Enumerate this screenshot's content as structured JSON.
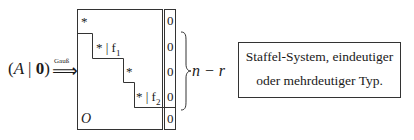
{
  "lhs": {
    "open": "(",
    "matrix": "A",
    "bar": "|",
    "zero_vector": "0",
    "close": ")"
  },
  "arrow": {
    "label": "Gauß",
    "glyph": "⟹"
  },
  "matrix": {
    "rows": [
      {
        "entry": "*",
        "rhs": "0"
      },
      {
        "entry": "* | f",
        "entry_sub": "1",
        "rhs": "0"
      },
      {
        "entry": "*",
        "rhs": "0"
      },
      {
        "entry": "* | f",
        "entry_sub": "2",
        "rhs": "0"
      }
    ],
    "zero_block": "O",
    "bottom_rhs": "0"
  },
  "brace": {
    "label": "n − r"
  },
  "info_box": {
    "line1": "Staffel-System, eindeutiger",
    "line2": "oder mehrdeutiger Typ."
  }
}
